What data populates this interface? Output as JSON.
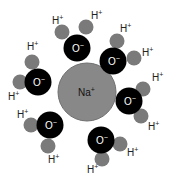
{
  "diagram": {
    "center_ion": {
      "label": "Na",
      "charge": "+",
      "cx": 87,
      "cy": 92,
      "r": 29,
      "color": "#888888"
    },
    "colors": {
      "oxygen": "#000000",
      "hydrogen": "#7a7a7a",
      "oxygen_text": "#ffffff"
    },
    "molecules": [
      {
        "o": {
          "cx": 77,
          "cy": 48,
          "label": "O",
          "charge": "−"
        },
        "h": [
          {
            "cx": 62,
            "cy": 32,
            "lx": 52,
            "ly": 24
          },
          {
            "cx": 86,
            "cy": 27,
            "lx": 91,
            "ly": 19
          }
        ]
      },
      {
        "o": {
          "cx": 113,
          "cy": 61,
          "label": "O",
          "charge": "−"
        },
        "h": [
          {
            "cx": 117,
            "cy": 41,
            "lx": 120,
            "ly": 32
          },
          {
            "cx": 134,
            "cy": 58,
            "lx": 142,
            "ly": 56
          }
        ]
      },
      {
        "o": {
          "cx": 38,
          "cy": 82,
          "label": "O",
          "charge": "−"
        },
        "h": [
          {
            "cx": 32,
            "cy": 62,
            "lx": 27,
            "ly": 50
          },
          {
            "cx": 20,
            "cy": 82,
            "lx": 8,
            "ly": 100
          }
        ]
      },
      {
        "o": {
          "cx": 129,
          "cy": 101,
          "label": "O",
          "charge": "−"
        },
        "h": [
          {
            "cx": 143,
            "cy": 89,
            "lx": 152,
            "ly": 81
          },
          {
            "cx": 141,
            "cy": 116,
            "lx": 148,
            "ly": 130
          }
        ]
      },
      {
        "o": {
          "cx": 50,
          "cy": 125,
          "label": "O",
          "charge": "−"
        },
        "h": [
          {
            "cx": 31,
            "cy": 125,
            "lx": 17,
            "ly": 118
          },
          {
            "cx": 48,
            "cy": 146,
            "lx": 48,
            "ly": 163
          }
        ]
      },
      {
        "o": {
          "cx": 101,
          "cy": 140,
          "label": "O",
          "charge": "−"
        },
        "h": [
          {
            "cx": 120,
            "cy": 144,
            "lx": 127,
            "ly": 156
          },
          {
            "cx": 102,
            "cy": 159,
            "lx": 87,
            "ly": 173
          }
        ]
      }
    ],
    "h_label": {
      "label": "H",
      "charge": "+"
    }
  }
}
